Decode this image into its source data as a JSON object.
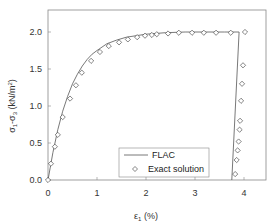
{
  "chart_data": {
    "type": "line",
    "title": "",
    "xlabel": "ε1 (%)",
    "xlabel_main": "ε",
    "xlabel_sub": "1",
    "xlabel_unit": " (%)",
    "ylabel": "σ1-σ3 (kN/m²)",
    "ylabel_parts": {
      "s1": "σ",
      "sub1": "1",
      "dash": "-σ",
      "sub3": "3",
      "unit": " (kN/m",
      "sup": "2",
      "close": ")"
    },
    "xlim": [
      0,
      4.4
    ],
    "ylim": [
      0,
      2.25
    ],
    "xticks": [
      0,
      1,
      2,
      3,
      4
    ],
    "xtick_labels": [
      "0",
      "1",
      "2",
      "3",
      "4"
    ],
    "yticks": [
      0,
      0.5,
      1.0,
      1.5,
      2.0
    ],
    "ytick_labels": [
      "0.0",
      "0.5",
      "1.0",
      "1.5",
      "2.0"
    ],
    "grid": false,
    "legend_position": "lower center-right, inside",
    "series": [
      {
        "name": "FLAC",
        "style": "line",
        "color": "#555555",
        "x": [
          0,
          0.1,
          0.2,
          0.3,
          0.4,
          0.5,
          0.6,
          0.7,
          0.8,
          0.9,
          1.0,
          1.2,
          1.4,
          1.6,
          1.8,
          2.0,
          2.4,
          2.8,
          3.2,
          3.6,
          3.9,
          3.75
        ],
        "y": [
          0,
          0.37,
          0.68,
          0.93,
          1.13,
          1.3,
          1.43,
          1.54,
          1.63,
          1.7,
          1.75,
          1.84,
          1.89,
          1.93,
          1.95,
          1.97,
          1.99,
          2.0,
          2.0,
          2.0,
          2.0,
          0
        ]
      },
      {
        "name": "Exact solution",
        "style": "marker",
        "marker": "diamond-open",
        "color": "#333333",
        "x": [
          0,
          0.06,
          0.14,
          0.2,
          0.3,
          0.45,
          0.57,
          0.69,
          0.88,
          1.06,
          1.24,
          1.45,
          1.63,
          1.82,
          1.98,
          2.12,
          2.22,
          2.45,
          2.67,
          2.94,
          3.18,
          3.43,
          3.73,
          4.02,
          3.98,
          3.96,
          3.94,
          3.92,
          3.91,
          3.89,
          3.87,
          3.85,
          3.82
        ],
        "y": [
          0,
          0.22,
          0.45,
          0.61,
          0.85,
          1.1,
          1.28,
          1.45,
          1.61,
          1.73,
          1.81,
          1.86,
          1.9,
          1.93,
          1.95,
          1.96,
          1.97,
          1.98,
          1.99,
          1.99,
          1.99,
          1.99,
          1.99,
          2.0,
          1.55,
          1.3,
          1.07,
          0.8,
          0.68,
          0.52,
          0.4,
          0.27,
          0.08
        ]
      }
    ]
  },
  "legend": {
    "items": [
      {
        "label": "FLAC",
        "symbol": "line"
      },
      {
        "label": "Exact solution",
        "symbol": "diamond"
      }
    ]
  }
}
